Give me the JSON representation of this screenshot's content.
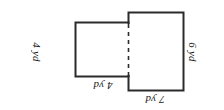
{
  "figure": {
    "orientation_note": "rotated-180",
    "stroke_color": "#2b2b2b",
    "fill_color": "#ffffff",
    "dashed_divider": true,
    "labels": {
      "left_side": "4 yd",
      "small_top": "4 yd",
      "large_top": "7 yd",
      "right_side": "6 yd"
    },
    "parts": [
      {
        "name": "small-rectangle",
        "width_label": "4 yd",
        "height_label": "4 yd"
      },
      {
        "name": "large-rectangle",
        "width_label": "7 yd",
        "height_label": "6 yd"
      }
    ]
  }
}
